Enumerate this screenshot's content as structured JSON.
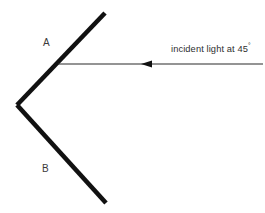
{
  "diagram": {
    "background_color": "#ffffff",
    "stroke_color": "#111111",
    "ray_color": "#2b2b2b",
    "text_color": "#3a3a3a",
    "labels": {
      "mirror_a": "A",
      "mirror_b": "B",
      "incident_ray_prefix": "incident light at 45",
      "incident_ray_degree": "°",
      "incident_ray_full": "incident light at 45°"
    },
    "geometry": {
      "vertex": {
        "x": 17,
        "y": 105
      },
      "mirror_a_end": {
        "x": 105,
        "y": 13
      },
      "mirror_b_end": {
        "x": 106,
        "y": 203
      },
      "ray_start": {
        "x": 263,
        "y": 64
      },
      "ray_end": {
        "x": 58,
        "y": 64
      },
      "arrow_tip": {
        "x": 141,
        "y": 64
      },
      "arrow_base": {
        "x": 152,
        "y": 64
      },
      "arrow_half_height": 3.6,
      "mirror_stroke_width": 4.6,
      "ray_stroke_width": 1.1,
      "incident_angle_degrees": 45
    }
  }
}
